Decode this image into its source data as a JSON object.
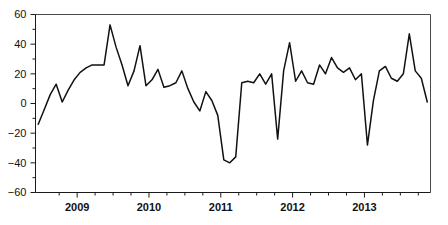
{
  "chart_data": {
    "type": "line",
    "title": "",
    "subtitle": "",
    "xlabel": "",
    "ylabel": "",
    "xlim": [
      2008.42,
      2013.92
    ],
    "ylim": [
      -60,
      60
    ],
    "grid": false,
    "legend": null,
    "y_ticks": [
      60,
      40,
      20,
      0,
      -20,
      -40,
      -60
    ],
    "y_tick_labels": [
      "60",
      "40",
      "20",
      "0",
      "−20",
      "−40",
      "−60"
    ],
    "y_minor_ticks": [
      50,
      30,
      10,
      -10,
      -30,
      -50
    ],
    "x_ticks": [
      2009,
      2010,
      2011,
      2012,
      2013
    ],
    "x_tick_labels": [
      "2009",
      "2010",
      "2011",
      "2012",
      "2013"
    ],
    "x_minor_ticks": [
      2008.75,
      2009.25,
      2009.5,
      2009.75,
      2010.25,
      2010.5,
      2010.75,
      2011.25,
      2011.5,
      2011.75,
      2012.25,
      2012.5,
      2012.75,
      2013.25,
      2013.5,
      2013.75
    ],
    "line_color": "#111111",
    "axis_color": "#1a1a1a",
    "frame_color": "#4a4a4a",
    "background_color": "#ffffff",
    "series": [
      {
        "name": "series-1",
        "x": [
          2008.458,
          2008.542,
          2008.625,
          2008.708,
          2008.792,
          2008.875,
          2008.958,
          2009.042,
          2009.125,
          2009.208,
          2009.292,
          2009.375,
          2009.458,
          2009.542,
          2009.625,
          2009.708,
          2009.792,
          2009.875,
          2009.958,
          2010.042,
          2010.125,
          2010.208,
          2010.292,
          2010.375,
          2010.458,
          2010.542,
          2010.625,
          2010.708,
          2010.792,
          2010.875,
          2010.958,
          2011.042,
          2011.125,
          2011.208,
          2011.292,
          2011.375,
          2011.458,
          2011.542,
          2011.625,
          2011.708,
          2011.792,
          2011.875,
          2011.958,
          2012.042,
          2012.125,
          2012.208,
          2012.292,
          2012.375,
          2012.458,
          2012.542,
          2012.625,
          2012.708,
          2012.792,
          2012.875,
          2012.958,
          2013.042,
          2013.125,
          2013.208,
          2013.292,
          2013.375,
          2013.458,
          2013.542,
          2013.625,
          2013.708,
          2013.792,
          2013.875
        ],
        "y": [
          -14,
          -4,
          6,
          13,
          1,
          9,
          16,
          21,
          24,
          26,
          26,
          26,
          53,
          38,
          26,
          12,
          22,
          39,
          12,
          16,
          23,
          11,
          12,
          14,
          22,
          10,
          1,
          -5,
          8,
          2,
          -8,
          -38,
          -40,
          -36,
          14,
          15,
          14,
          20,
          13,
          20,
          -24,
          22,
          41,
          15,
          22,
          14,
          13,
          26,
          20,
          31,
          24,
          21,
          24,
          16,
          20,
          -28,
          2,
          22,
          25,
          17,
          15,
          20,
          47,
          22,
          17,
          1
        ]
      }
    ]
  }
}
